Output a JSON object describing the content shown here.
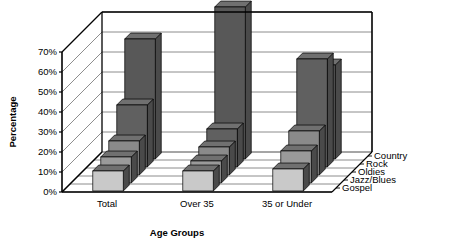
{
  "chart_data": {
    "type": "bar",
    "title": "",
    "subtitle": "",
    "xlabel": "Age Groups",
    "ylabel": "Percentage",
    "categories": [
      "Total",
      "Over 35",
      "35 or Under"
    ],
    "series": [
      {
        "name": "Country",
        "values": [
          60,
          76,
          47
        ]
      },
      {
        "name": "Rock",
        "values": [
          31,
          19,
          54
        ]
      },
      {
        "name": "Oldies",
        "values": [
          17,
          14,
          22
        ]
      },
      {
        "name": "Jazz/Blues",
        "values": [
          13,
          11,
          16
        ]
      },
      {
        "name": "Gospel",
        "values": [
          10,
          10,
          11
        ]
      }
    ],
    "ylim": [
      0,
      70
    ],
    "yticks": [
      "0%",
      "10%",
      "20%",
      "30%",
      "40%",
      "50%",
      "60%",
      "70%"
    ],
    "ytick_values": [
      0,
      10,
      20,
      30,
      40,
      50,
      60,
      70
    ],
    "grid": true,
    "legend_position": "right-inline-depth-axis",
    "projection": "3d-isometric",
    "colors": {
      "Country": "#585858",
      "Rock": "#606060",
      "Oldies": "#8a8a8a",
      "Jazz/Blues": "#9a9a9a",
      "Gospel": "#c9c9c9",
      "top_shade": "#707070",
      "side_shade": "#4a4a4a",
      "axis": "#000000",
      "grid": "#808080",
      "floor": "#ffffff",
      "background": "#ffffff"
    }
  },
  "axes": {
    "y_title": "Percentage",
    "x_title": "Age Groups"
  }
}
